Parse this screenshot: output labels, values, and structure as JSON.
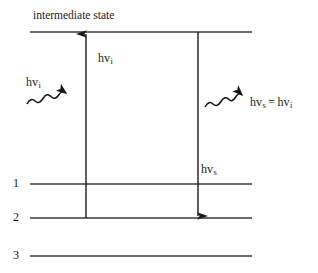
{
  "diagram": {
    "title": "intermediate state",
    "line_color": "#3a3a3a",
    "text_color": "#1a1a1a",
    "levels": [
      {
        "id": "intermediate",
        "label": "",
        "y": 32
      },
      {
        "id": "level-1",
        "label": "1",
        "y": 184
      },
      {
        "id": "level-2",
        "label": "2",
        "y": 218
      },
      {
        "id": "level-3",
        "label": "3",
        "y": 256
      }
    ],
    "transitions": [
      {
        "id": "absorption",
        "direction": "up",
        "x": 86,
        "from_y": 218,
        "to_y": 32,
        "label_base": "hv",
        "label_sub": "i"
      },
      {
        "id": "emission",
        "direction": "down",
        "x": 198,
        "from_y": 32,
        "to_y": 218,
        "label_base": "hv",
        "label_sub": "s"
      }
    ],
    "photons": [
      {
        "id": "incident-photon",
        "label_base": "hv",
        "label_sub": "i",
        "equality": "",
        "label2_base": "",
        "label2_sub": ""
      },
      {
        "id": "scattered-photon",
        "label_base": "hv",
        "label_sub": "s",
        "equality": "=",
        "label2_base": "hv",
        "label2_sub": "i"
      }
    ]
  }
}
